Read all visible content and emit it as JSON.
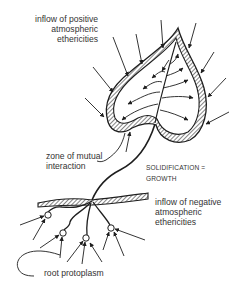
{
  "diagram": {
    "labels": {
      "positive_inflow": [
        "inflow of positive",
        "atmospheric",
        "ethericities"
      ],
      "zone": [
        "zone of mutual",
        "interaction"
      ],
      "solidification": [
        "SOLIDIFICATION =",
        "GROWTH"
      ],
      "negative_inflow": [
        "inflow of negative",
        "atmospheric",
        "ethericities"
      ],
      "root": [
        "root protoplasm"
      ]
    },
    "parts": [
      "leaf",
      "stem",
      "ground-line",
      "roots",
      "inflow-arrows"
    ],
    "colors": {
      "ink": "#1e1e1e",
      "paper": "#ffffff"
    }
  }
}
